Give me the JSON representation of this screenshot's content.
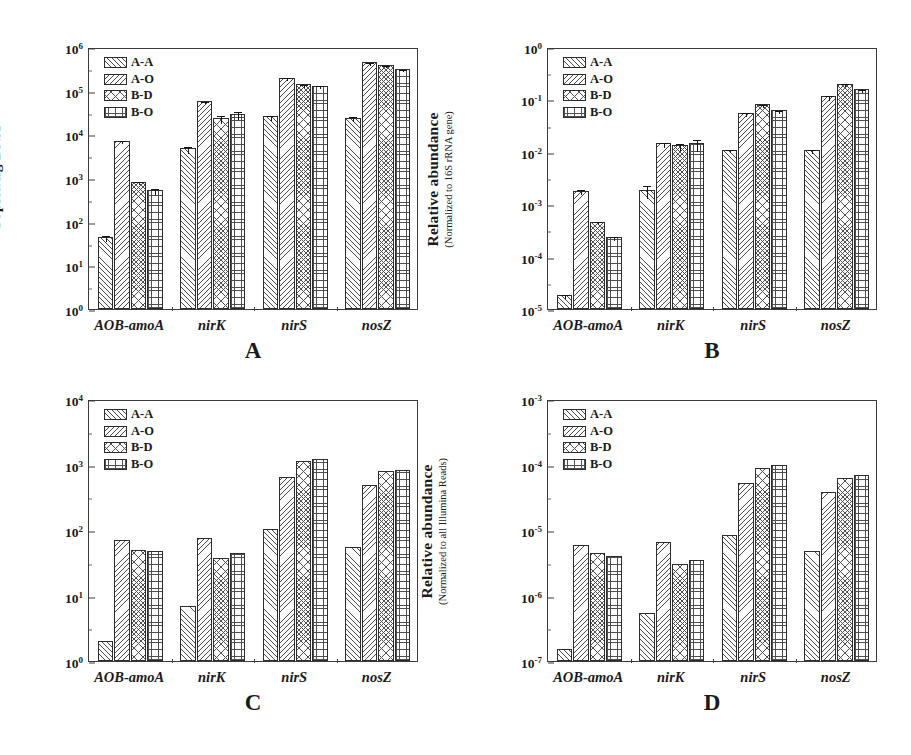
{
  "figure": {
    "series": [
      {
        "key": "A-A",
        "label": "A-A",
        "pattern": "diagonal-hatch-right"
      },
      {
        "key": "A-O",
        "label": "A-O",
        "pattern": "diagonal-hatch-left"
      },
      {
        "key": "B-D",
        "label": "B-D",
        "pattern": "cross-hatch"
      },
      {
        "key": "B-O",
        "label": "B-O",
        "pattern": "grid-hatch"
      }
    ],
    "categories": [
      "AOB-amoA",
      "nirK",
      "nirS",
      "nosZ"
    ]
  },
  "chart_data": [
    {
      "type": "bar",
      "panel": "A",
      "panel_letter": "A",
      "title": "",
      "xlabel": "",
      "ylabel": "Copies/ng DNA",
      "ylabel_sub": "",
      "yscale": "log",
      "ylim": [
        1,
        1000000
      ],
      "ytick_labels": [
        "10<sup>0</sup>",
        "10<sup>1</sup>",
        "10<sup>2</sup>",
        "10<sup>3</sup>",
        "10<sup>4</sup>",
        "10<sup>5</sup>",
        "10<sup>6</sup>"
      ],
      "ytick_values": [
        1,
        10,
        100,
        1000,
        10000,
        100000,
        1000000
      ],
      "grid": false,
      "legend_position": "top-left",
      "categories": [
        "AOB-amoA",
        "nirK",
        "nirS",
        "nosZ"
      ],
      "series": [
        {
          "name": "A-A",
          "values": [
            45,
            4800,
            26000,
            24000
          ],
          "errors": [
            6,
            900,
            3000,
            3000
          ]
        },
        {
          "name": "A-O",
          "values": [
            7200,
            58000,
            200000,
            450000
          ],
          "errors": [
            700,
            4000,
            14000,
            35000
          ]
        },
        {
          "name": "B-D",
          "values": [
            820,
            24000,
            140000,
            380000
          ],
          "errors": [
            70,
            4500,
            9000,
            20000
          ]
        },
        {
          "name": "B-O",
          "values": [
            540,
            30000,
            130000,
            320000
          ],
          "errors": [
            90,
            6000,
            9000,
            17000
          ]
        }
      ]
    },
    {
      "type": "bar",
      "panel": "B",
      "panel_letter": "B",
      "title": "",
      "xlabel": "",
      "ylabel": "Relative abundance",
      "ylabel_sub": "(Normalized to 16S rRNA gene)",
      "yscale": "log",
      "ylim": [
        1e-05,
        1
      ],
      "ytick_labels": [
        "10<sup>-5</sup>",
        "10<sup>-4</sup>",
        "10<sup>-3</sup>",
        "10<sup>-2</sup>",
        "10<sup>-1</sup>",
        "10<sup>0</sup>"
      ],
      "ytick_values": [
        1e-05,
        0.0001,
        0.001,
        0.01,
        0.1,
        1
      ],
      "grid": false,
      "legend_position": "top-left",
      "categories": [
        "AOB-amoA",
        "nirK",
        "nirS",
        "nosZ"
      ],
      "series": [
        {
          "name": "A-A",
          "values": [
            1.85e-05,
            0.0019,
            0.011,
            0.011
          ],
          "errors": [
            1.5e-06,
            0.0005,
            0.0008,
            0.0009
          ]
        },
        {
          "name": "A-O",
          "values": [
            0.0018,
            0.0145,
            0.055,
            0.115
          ],
          "errors": [
            0.0002,
            0.0015,
            0.004,
            0.012
          ]
        },
        {
          "name": "B-D",
          "values": [
            0.00046,
            0.0135,
            0.08,
            0.2
          ],
          "errors": [
            3e-05,
            0.002,
            0.005,
            0.012
          ]
        },
        {
          "name": "B-O",
          "values": [
            0.00024,
            0.0145,
            0.062,
            0.155
          ],
          "errors": [
            2e-05,
            0.0035,
            0.004,
            0.011
          ]
        }
      ]
    },
    {
      "type": "bar",
      "panel": "C",
      "panel_letter": "C",
      "title": "",
      "xlabel": "",
      "ylabel": "Number of Reads",
      "ylabel_sub": "",
      "yscale": "log",
      "ylim": [
        1,
        10000
      ],
      "ytick_labels": [
        "10<sup>0</sup>",
        "10<sup>1</sup>",
        "10<sup>2</sup>",
        "10<sup>3</sup>",
        "10<sup>4</sup>"
      ],
      "ytick_values": [
        1,
        10,
        100,
        1000,
        10000
      ],
      "grid": false,
      "legend_position": "top-left",
      "categories": [
        "AOB-amoA",
        "nirK",
        "nirS",
        "nosZ"
      ],
      "series": [
        {
          "name": "A-A",
          "values": [
            2,
            7,
            105,
            55
          ],
          "errors": [
            0,
            0,
            0,
            0
          ]
        },
        {
          "name": "A-O",
          "values": [
            70,
            76,
            650,
            480
          ],
          "errors": [
            0,
            0,
            0,
            0
          ]
        },
        {
          "name": "B-D",
          "values": [
            50,
            38,
            1150,
            800
          ],
          "errors": [
            0,
            0,
            0,
            0
          ]
        },
        {
          "name": "B-O",
          "values": [
            47,
            45,
            1200,
            830
          ],
          "errors": [
            0,
            0,
            0,
            0
          ]
        }
      ]
    },
    {
      "type": "bar",
      "panel": "D",
      "panel_letter": "D",
      "title": "",
      "xlabel": "",
      "ylabel": "Relative abundance",
      "ylabel_sub": "(Normalized to all Illumina Reads)",
      "yscale": "log",
      "ylim": [
        1e-07,
        0.001
      ],
      "ytick_labels": [
        "10<sup>-7</sup>",
        "10<sup>-6</sup>",
        "10<sup>-5</sup>",
        "10<sup>-4</sup>",
        "10<sup>-3</sup>"
      ],
      "ytick_values": [
        1e-07,
        1e-06,
        1e-05,
        0.0001,
        0.001
      ],
      "grid": false,
      "legend_position": "top-left",
      "categories": [
        "AOB-amoA",
        "nirK",
        "nirS",
        "nosZ"
      ],
      "series": [
        {
          "name": "A-A",
          "values": [
            1.5e-07,
            5.5e-07,
            8.5e-06,
            4.7e-06
          ],
          "errors": [
            0,
            0,
            0,
            0
          ]
        },
        {
          "name": "A-O",
          "values": [
            6e-06,
            6.5e-06,
            5.2e-05,
            3.8e-05
          ],
          "errors": [
            0,
            0,
            0,
            0
          ]
        },
        {
          "name": "B-D",
          "values": [
            4.4e-06,
            3e-06,
            9e-05,
            6.3e-05
          ],
          "errors": [
            0,
            0,
            0,
            0
          ]
        },
        {
          "name": "B-O",
          "values": [
            4e-06,
            3.5e-06,
            9.7e-05,
            6.8e-05
          ],
          "errors": [
            0,
            0,
            0,
            0
          ]
        }
      ]
    }
  ]
}
